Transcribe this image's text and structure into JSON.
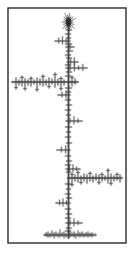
{
  "figure": {
    "type": "fractal-dendrite",
    "width": 134,
    "height": 257,
    "background_color": "#ffffff",
    "ink_color": "#3a3a3a",
    "ink_color_dark": "#1c1c1c",
    "halo_color": "#9a9a9a"
  },
  "frame": {
    "name": "border-frame",
    "x": 8,
    "y": 8,
    "width": 118,
    "height": 235,
    "stroke_color": "#2b2b2b",
    "stroke_width": 1.4,
    "fill_color": "#ffffff"
  },
  "chart_data": {
    "type": "scatter",
    "subtitle": "",
    "xlabel": "",
    "ylabel": "",
    "xlim": [
      8,
      126
    ],
    "ylim": [
      8,
      243
    ],
    "grid": false,
    "legend": null,
    "annotations": [],
    "tick_labels": {
      "x": [],
      "y": []
    },
    "trunk": {
      "name": "main-vertical-trunk",
      "x": 68.5,
      "y_top": 22,
      "y_bottom": 238,
      "width": 1.6
    },
    "top_bud": {
      "name": "terminal-bud-cluster",
      "cx": 68.5,
      "cy": 22,
      "rx": 4.5,
      "ry": 6.5
    },
    "base_cluster": {
      "name": "base-noise-cluster",
      "cx": 68,
      "cy": 235,
      "x_start": 44,
      "x_end": 96,
      "spike_count": 44
    },
    "major_branches": [
      {
        "name": "left-branch-upper",
        "y": 82,
        "x_start": 12,
        "x_end": 78,
        "width": 1.5,
        "direction": "left"
      },
      {
        "name": "right-branch-lower",
        "y": 178,
        "x_start": 68,
        "x_end": 122,
        "width": 1.5,
        "direction": "right"
      }
    ],
    "minor_branches": [
      {
        "y": 41,
        "x_start": 55,
        "x_end": 70,
        "direction": "left"
      },
      {
        "y": 47,
        "x_start": 66,
        "x_end": 74,
        "direction": "right"
      },
      {
        "y": 62,
        "x_start": 67,
        "x_end": 78,
        "direction": "right"
      },
      {
        "y": 68,
        "x_start": 66,
        "x_end": 87,
        "direction": "right"
      },
      {
        "y": 95,
        "x_start": 58,
        "x_end": 70,
        "direction": "left"
      },
      {
        "y": 121,
        "x_start": 66,
        "x_end": 82,
        "direction": "right"
      },
      {
        "y": 150,
        "x_start": 57,
        "x_end": 70,
        "direction": "left"
      },
      {
        "y": 169,
        "x_start": 66,
        "x_end": 80,
        "direction": "right"
      },
      {
        "y": 203,
        "x_start": 56,
        "x_end": 70,
        "direction": "left"
      },
      {
        "y": 223,
        "x_start": 66,
        "x_end": 82,
        "direction": "right"
      }
    ],
    "trunk_ticks": [
      {
        "y": 30,
        "len_left": 2,
        "len_right": 3
      },
      {
        "y": 34,
        "len_left": 3,
        "len_right": 2
      },
      {
        "y": 38,
        "len_left": 2,
        "len_right": 2
      },
      {
        "y": 44,
        "len_left": 3,
        "len_right": 3
      },
      {
        "y": 51,
        "len_left": 2,
        "len_right": 4
      },
      {
        "y": 55,
        "len_left": 3,
        "len_right": 2
      },
      {
        "y": 58,
        "len_left": 2,
        "len_right": 3
      },
      {
        "y": 65,
        "len_left": 3,
        "len_right": 2
      },
      {
        "y": 72,
        "len_left": 2,
        "len_right": 3
      },
      {
        "y": 76,
        "len_left": 3,
        "len_right": 2
      },
      {
        "y": 88,
        "len_left": 3,
        "len_right": 3
      },
      {
        "y": 92,
        "len_left": 2,
        "len_right": 2
      },
      {
        "y": 100,
        "len_left": 3,
        "len_right": 2
      },
      {
        "y": 105,
        "len_left": 2,
        "len_right": 3
      },
      {
        "y": 110,
        "len_left": 3,
        "len_right": 2
      },
      {
        "y": 115,
        "len_left": 2,
        "len_right": 2
      },
      {
        "y": 127,
        "len_left": 3,
        "len_right": 3
      },
      {
        "y": 132,
        "len_left": 2,
        "len_right": 2
      },
      {
        "y": 137,
        "len_left": 3,
        "len_right": 2
      },
      {
        "y": 143,
        "len_left": 2,
        "len_right": 3
      },
      {
        "y": 156,
        "len_left": 3,
        "len_right": 2
      },
      {
        "y": 161,
        "len_left": 2,
        "len_right": 3
      },
      {
        "y": 165,
        "len_left": 3,
        "len_right": 2
      },
      {
        "y": 172,
        "len_left": 2,
        "len_right": 2
      },
      {
        "y": 184,
        "len_left": 3,
        "len_right": 3
      },
      {
        "y": 189,
        "len_left": 2,
        "len_right": 2
      },
      {
        "y": 194,
        "len_left": 3,
        "len_right": 2
      },
      {
        "y": 198,
        "len_left": 2,
        "len_right": 3
      },
      {
        "y": 209,
        "len_left": 3,
        "len_right": 2
      },
      {
        "y": 214,
        "len_left": 2,
        "len_right": 3
      },
      {
        "y": 218,
        "len_left": 3,
        "len_right": 2
      },
      {
        "y": 228,
        "len_left": 2,
        "len_right": 3
      },
      {
        "y": 231,
        "len_left": 3,
        "len_right": 2
      }
    ],
    "left_branch_spikes": [
      {
        "x": 16,
        "up": 4,
        "down": 7
      },
      {
        "x": 19,
        "up": 2,
        "down": 3
      },
      {
        "x": 22,
        "up": 6,
        "down": 4
      },
      {
        "x": 25,
        "up": 3,
        "down": 8
      },
      {
        "x": 28,
        "up": 2,
        "down": 3
      },
      {
        "x": 31,
        "up": 5,
        "down": 4
      },
      {
        "x": 34,
        "up": 2,
        "down": 2
      },
      {
        "x": 37,
        "up": 4,
        "down": 9
      },
      {
        "x": 40,
        "up": 3,
        "down": 3
      },
      {
        "x": 43,
        "up": 7,
        "down": 4
      },
      {
        "x": 46,
        "up": 2,
        "down": 3
      },
      {
        "x": 49,
        "up": 4,
        "down": 6
      },
      {
        "x": 52,
        "up": 3,
        "down": 2
      },
      {
        "x": 55,
        "up": 9,
        "down": 5
      },
      {
        "x": 58,
        "up": 3,
        "down": 3
      },
      {
        "x": 61,
        "up": 5,
        "down": 8
      },
      {
        "x": 64,
        "up": 2,
        "down": 3
      },
      {
        "x": 72,
        "up": 6,
        "down": 4
      },
      {
        "x": 75,
        "up": 3,
        "down": 2
      }
    ],
    "right_branch_spikes": [
      {
        "x": 72,
        "up": 5,
        "down": 8
      },
      {
        "x": 75,
        "up": 3,
        "down": 3
      },
      {
        "x": 78,
        "up": 7,
        "down": 4
      },
      {
        "x": 81,
        "up": 2,
        "down": 6
      },
      {
        "x": 84,
        "up": 4,
        "down": 3
      },
      {
        "x": 87,
        "up": 3,
        "down": 5
      },
      {
        "x": 90,
        "up": 6,
        "down": 3
      },
      {
        "x": 93,
        "up": 2,
        "down": 4
      },
      {
        "x": 96,
        "up": 4,
        "down": 2
      },
      {
        "x": 99,
        "up": 3,
        "down": 6
      },
      {
        "x": 102,
        "up": 5,
        "down": 3
      },
      {
        "x": 105,
        "up": 2,
        "down": 2
      },
      {
        "x": 108,
        "up": 9,
        "down": 5
      },
      {
        "x": 111,
        "up": 4,
        "down": 7
      },
      {
        "x": 114,
        "up": 2,
        "down": 3
      },
      {
        "x": 117,
        "up": 5,
        "down": 2
      },
      {
        "x": 120,
        "up": 3,
        "down": 4
      }
    ],
    "base_spikes": [
      {
        "x": 46,
        "up": 2,
        "down": 1
      },
      {
        "x": 48,
        "up": 3,
        "down": 2
      },
      {
        "x": 50,
        "up": 1,
        "down": 2
      },
      {
        "x": 52,
        "up": 4,
        "down": 1
      },
      {
        "x": 54,
        "up": 2,
        "down": 3
      },
      {
        "x": 56,
        "up": 3,
        "down": 1
      },
      {
        "x": 58,
        "up": 1,
        "down": 2
      },
      {
        "x": 60,
        "up": 5,
        "down": 2
      },
      {
        "x": 62,
        "up": 2,
        "down": 1
      },
      {
        "x": 64,
        "up": 3,
        "down": 3
      },
      {
        "x": 66,
        "up": 1,
        "down": 2
      },
      {
        "x": 70,
        "up": 4,
        "down": 2
      },
      {
        "x": 72,
        "up": 2,
        "down": 1
      },
      {
        "x": 74,
        "up": 3,
        "down": 2
      },
      {
        "x": 76,
        "up": 1,
        "down": 3
      },
      {
        "x": 78,
        "up": 4,
        "down": 1
      },
      {
        "x": 80,
        "up": 2,
        "down": 2
      },
      {
        "x": 82,
        "up": 3,
        "down": 1
      },
      {
        "x": 84,
        "up": 1,
        "down": 2
      },
      {
        "x": 86,
        "up": 2,
        "down": 1
      },
      {
        "x": 88,
        "up": 3,
        "down": 2
      },
      {
        "x": 90,
        "up": 1,
        "down": 1
      },
      {
        "x": 92,
        "up": 2,
        "down": 2
      }
    ]
  }
}
